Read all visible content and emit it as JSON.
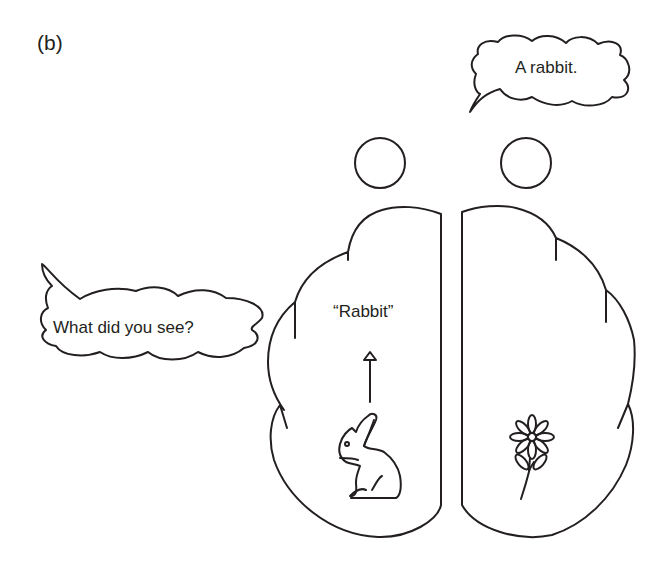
{
  "figure": {
    "panel_label": "(b)",
    "speech_bubbles": {
      "right_person": {
        "text": "A rabbit."
      },
      "left_examiner": {
        "text": "What did you see?"
      }
    },
    "left_hemisphere": {
      "verbal_label": "“Rabbit”",
      "stimulus_icon": "rabbit-icon"
    },
    "right_hemisphere": {
      "stimulus_icon": "flower-icon"
    },
    "heads": [
      "left-head-circle",
      "right-head-circle"
    ],
    "colors": {
      "stroke": "#231f20",
      "background": "#ffffff"
    }
  }
}
